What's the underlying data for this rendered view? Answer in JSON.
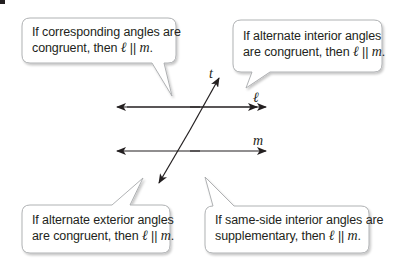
{
  "diagram": {
    "type": "parallel-lines-converse-theorems",
    "lines": {
      "l": {
        "label": "ℓ"
      },
      "m": {
        "label": "m"
      },
      "t": {
        "label": "t"
      }
    },
    "callouts": [
      {
        "id": "corresponding",
        "line1": "If corresponding angles are",
        "line2_prefix": "congruent, then ",
        "l": "ℓ",
        "parallel": " || ",
        "m": "m",
        "end": "."
      },
      {
        "id": "alternate-interior",
        "line1": "If alternate interior angles",
        "line2_prefix": "are congruent, then ",
        "l": "ℓ",
        "parallel": " || ",
        "m": "m",
        "end": "."
      },
      {
        "id": "alternate-exterior",
        "line1": "If alternate exterior angles",
        "line2_prefix": "are congruent, then ",
        "l": "ℓ",
        "parallel": " || ",
        "m": "m",
        "end": "."
      },
      {
        "id": "same-side-interior",
        "line1": "If same-side interior angles are",
        "line2_prefix": "supplementary, then ",
        "l": "ℓ",
        "parallel": " || ",
        "m": "m",
        "end": "."
      }
    ],
    "colors": {
      "line": "#231f20",
      "callout_border": "#a7a9ac",
      "callout_fill": "#ffffff",
      "shadow": "#d1d3d4"
    }
  }
}
